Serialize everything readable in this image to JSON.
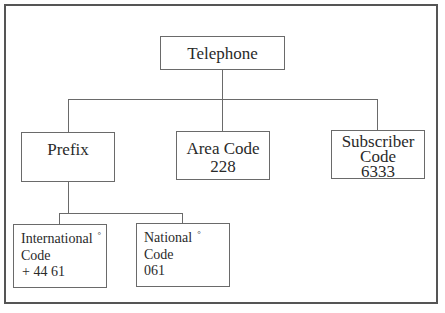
{
  "diagram": {
    "root": {
      "label": "Telephone"
    },
    "children": [
      {
        "label": "Prefix",
        "value": ""
      },
      {
        "label": "Area Code",
        "value": "228"
      },
      {
        "label_line1": "Subscriber",
        "label_line2": "Code",
        "value": "6333"
      }
    ],
    "prefix_children": [
      {
        "label_line1": "International",
        "marker": "°",
        "label_line2": "Code",
        "value": "+ 44 61"
      },
      {
        "label_line1": "National",
        "marker": "°",
        "label_line2": "Code",
        "value": "061"
      }
    ]
  }
}
